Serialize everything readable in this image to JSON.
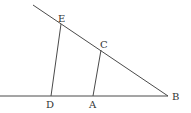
{
  "figure": {
    "points": {
      "E": {
        "label": "E",
        "x": 61,
        "y": 23
      },
      "C": {
        "label": "C",
        "x": 101,
        "y": 49
      },
      "B": {
        "label": "B",
        "x": 168,
        "y": 96
      },
      "D": {
        "label": "D",
        "x": 51,
        "y": 96
      },
      "A": {
        "label": "A",
        "x": 93,
        "y": 96
      }
    },
    "labels": {
      "E": "E",
      "C": "C",
      "B": "B",
      "D": "D",
      "A": "A"
    },
    "colors": {
      "line": "#4a4a4a",
      "text": "#333333",
      "background": "#ffffff"
    }
  }
}
